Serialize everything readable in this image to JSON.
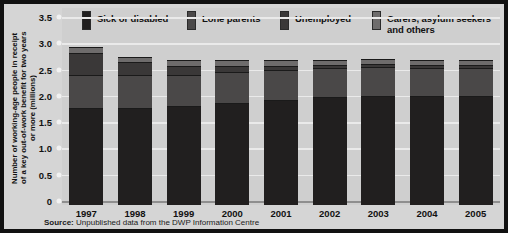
{
  "source_note": {
    "prefix": "Source:",
    "text": " Unpublished data from the DWP Information Centre"
  },
  "axis": {
    "ytitle": "Number of working-age people in receipt\nof a key out-of-work benefit for two years\nor more (millions)",
    "yticks": [
      "3.5",
      "3.0",
      "2.5",
      "2.0",
      "1.5",
      "1.0",
      "0.5",
      "0"
    ]
  },
  "legend": [
    {
      "label": "Sick or disabled",
      "color": "#211f1f"
    },
    {
      "label": "Lone parents",
      "color": "#4a4848"
    },
    {
      "label": "Unemployed",
      "color": "#3a3838"
    },
    {
      "label": "Carers, asylum seekers\nand others",
      "color": "#6e6c6c"
    }
  ],
  "chart_data": {
    "type": "bar",
    "stacked": true,
    "title": "",
    "xlabel": "",
    "ylabel": "Number of working-age people in receipt of a key out-of-work benefit for two years or more (millions)",
    "categories": [
      "1997",
      "1998",
      "1999",
      "2000",
      "2001",
      "2002",
      "2003",
      "2004",
      "2005"
    ],
    "ylim": [
      0,
      3.5
    ],
    "ytick_step": 0.5,
    "grid": true,
    "legend_position": "top",
    "series": [
      {
        "name": "Sick or disabled",
        "color": "#211f1f",
        "values": [
          1.85,
          1.85,
          1.88,
          1.95,
          2.0,
          2.05,
          2.08,
          2.08,
          2.08
        ]
      },
      {
        "name": "Lone parents",
        "color": "#4a4848",
        "values": [
          0.62,
          0.62,
          0.6,
          0.58,
          0.56,
          0.55,
          0.54,
          0.53,
          0.52
        ]
      },
      {
        "name": "Unemployed",
        "color": "#3a3838",
        "values": [
          0.43,
          0.25,
          0.16,
          0.11,
          0.08,
          0.06,
          0.06,
          0.06,
          0.06
        ]
      },
      {
        "name": "Carers, asylum seekers and others",
        "color": "#6e6c6c",
        "values": [
          0.1,
          0.1,
          0.11,
          0.11,
          0.11,
          0.1,
          0.09,
          0.09,
          0.09
        ]
      }
    ],
    "totals": [
      3.0,
      2.82,
      2.75,
      2.75,
      2.75,
      2.76,
      2.77,
      2.76,
      2.75
    ]
  }
}
